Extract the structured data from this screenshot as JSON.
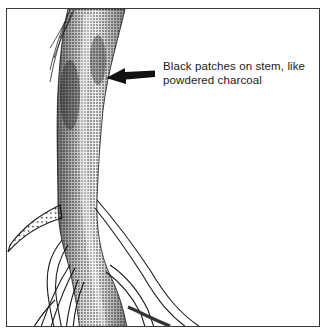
{
  "figure": {
    "annotation": {
      "line1": "Black patches on stem, like",
      "line2": "powdered charcoal"
    },
    "colors": {
      "ink": "#1a1a1a",
      "frame": "#3a3a3a",
      "background": "#ffffff"
    }
  }
}
